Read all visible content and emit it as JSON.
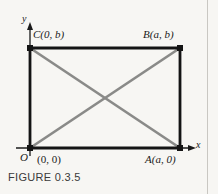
{
  "figure": {
    "caption": "FIGURE 0.3.5",
    "type": "geometry-diagram",
    "shape": "rectangle-with-diagonals",
    "background_color": "#f7f6f3",
    "outline_color": "#141414",
    "diagonal_color": "#8a8a88",
    "axis_color": "#1a1a1a"
  },
  "axes": {
    "x_label": "x",
    "y_label": "y",
    "origin_label": "O"
  },
  "vertices": [
    {
      "id": "origin",
      "label": "(0, 0)",
      "position": "bottom-left"
    },
    {
      "id": "A",
      "label": "A(a, 0)",
      "position": "bottom-right"
    },
    {
      "id": "B",
      "label": "B(a, b)",
      "position": "top-right"
    },
    {
      "id": "C",
      "label": "C(0, b)",
      "position": "top-left"
    }
  ],
  "geometry": {
    "rect_left": 30,
    "rect_top": 48,
    "rect_right": 180,
    "rect_bottom": 148,
    "dot_size": 5
  }
}
